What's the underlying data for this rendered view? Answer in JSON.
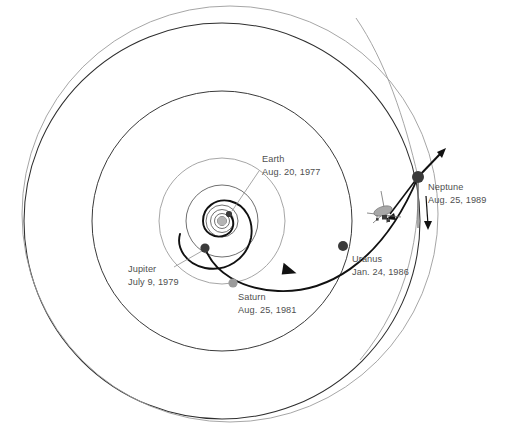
{
  "diagram": {
    "background_color": "#ffffff",
    "label_color": "#4f4f4f",
    "trajectory_color": "#111111",
    "orbit_color": "#2e2e2e",
    "faint_orbit_color": "#9c9c9c",
    "sun": {
      "name": "Sun",
      "color": "#b4b4b4",
      "cx": 222,
      "cy": 221
    },
    "encounters": [
      {
        "id": "earth",
        "body": "Earth",
        "date": "Aug. 20, 1977",
        "marker_color": "#3a3a3a",
        "marker_radius": 3.1,
        "marker_cx": 229,
        "marker_cy": 214,
        "label_x": 262,
        "label_y": 162,
        "leader": "M 258 170 L 232 211"
      },
      {
        "id": "jupiter",
        "body": "Jupiter",
        "date": "July 9, 1979",
        "marker_color": "#3a3a3a",
        "marker_radius": 4.6,
        "marker_cx": 205,
        "marker_cy": 248,
        "label_x": 128,
        "label_y": 272,
        "leader": "M 174 268 L 202 252"
      },
      {
        "id": "saturn",
        "body": "Saturn",
        "date": "Aug. 25, 1981",
        "marker_color": "#9b9b9b",
        "marker_radius": 4.6,
        "marker_cx": 233,
        "marker_cy": 283,
        "label_x": 238,
        "label_y": 298,
        "leader": ""
      },
      {
        "id": "uranus",
        "body": "Uranus",
        "date": "Jan. 24, 1986",
        "marker_color": "#3a3a3a",
        "marker_radius": 5.0,
        "marker_cx": 343,
        "marker_cy": 246,
        "label_x": 352,
        "label_y": 261,
        "leader": ""
      },
      {
        "id": "neptune",
        "body": "Neptune",
        "date": "Aug. 25, 1989",
        "marker_color": "#222222",
        "marker_radius": 6.0,
        "marker_cx": 418,
        "marker_cy": 177,
        "label_x": 427,
        "label_y": 190,
        "leader": ""
      }
    ],
    "spacecraft": {
      "name": "Voyager spacecraft",
      "cx": 385,
      "cy": 215
    },
    "orbits": [
      {
        "id": "neptune-orbit",
        "rx": 198,
        "ry": 198,
        "class": "orbit-outer"
      },
      {
        "id": "uranus-orbit",
        "rx": 130,
        "ry": 130,
        "class": "orbit-mid"
      },
      {
        "id": "saturn-orbit",
        "rx": 63,
        "ry": 63,
        "class": "orbit-faint"
      },
      {
        "id": "jupiter-orbit",
        "rx": 36,
        "ry": 36,
        "class": "orbit-inner"
      },
      {
        "id": "mars-orbit",
        "rx": 16,
        "ry": 16,
        "class": "orbit-tiny"
      },
      {
        "id": "earth-orbit",
        "rx": 11,
        "ry": 11,
        "class": "orbit-tiny"
      },
      {
        "id": "venus-orbit",
        "rx": 7.5,
        "ry": 7.5,
        "class": "orbit-tiny"
      },
      {
        "id": "mercury-orbit",
        "rx": 4.5,
        "ry": 4.5,
        "class": "orbit-tiny"
      }
    ]
  }
}
